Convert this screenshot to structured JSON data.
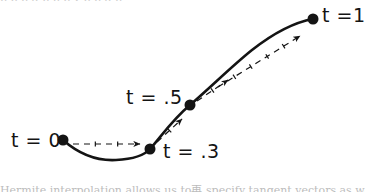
{
  "figure": {
    "background_color": "#ffffff",
    "ink_color": "#141414",
    "clipped_text_top": "p p p q p p p y p p q p",
    "clipped_text_bottom": "Hermite interpolation allows us to再 specify tangent vectors as well as positions",
    "labels": [
      {
        "id": "t0",
        "text": "t = 0",
        "value": 0.0
      },
      {
        "id": "t03",
        "text": "t = .3",
        "value": 0.3
      },
      {
        "id": "t05",
        "text": "t = .5",
        "value": 0.5
      },
      {
        "id": "t1",
        "text": "t =1",
        "value": 1.0
      }
    ]
  },
  "chart_data": {
    "type": "line",
    "title": "",
    "subtitle": "",
    "xlabel": "",
    "ylabel": "",
    "xlim": [
      0,
      365
    ],
    "ylim": [
      192,
      0
    ],
    "grid": false,
    "legend": "none",
    "knots": [
      {
        "label": "t = 0",
        "t": 0.0,
        "x": 63,
        "y": 140
      },
      {
        "label": "t = .3",
        "t": 0.3,
        "x": 150,
        "y": 149
      },
      {
        "label": "t = .5",
        "t": 0.5,
        "x": 190,
        "y": 105
      },
      {
        "label": "t =1",
        "t": 1.0,
        "x": 313,
        "y": 19
      }
    ],
    "curve_path": "M 63 140 C 80 155, 98 161, 116 160 C 134 159, 144 156, 150 149 C 160 138, 172 120, 190 105 C 212 86, 232 66, 252 50 C 275 32, 296 22, 313 19",
    "tangent_arrows": [
      {
        "at_knot": "t = 0",
        "style": "dashed-with-arrowhead",
        "x1": 73,
        "y1": 144,
        "x2": 140,
        "y2": 144,
        "direction": "horizontal-right",
        "tick_count": 2
      },
      {
        "at_knot": "t = .3",
        "style": "dashed-with-arrowhead",
        "x1": 157,
        "y1": 142,
        "x2": 182,
        "y2": 119,
        "direction": "up-right",
        "tick_count": 1
      },
      {
        "at_knot": "t = .5",
        "style": "dashed-with-arrowhead",
        "x1": 197,
        "y1": 101,
        "x2": 228,
        "y2": 80,
        "direction": "up-right",
        "tick_count": 1
      },
      {
        "at_knot": "t =1",
        "style": "long-dashed-with-arrowhead",
        "x1": 218,
        "y1": 87,
        "x2": 300,
        "y2": 36,
        "direction": "up-right",
        "tick_count": 4
      }
    ],
    "marker": {
      "shape": "circle",
      "radius": 5.5,
      "color": "#141414"
    },
    "line": {
      "color": "#141414",
      "width": 2.6,
      "style": "solid"
    },
    "dash": {
      "color": "#141414",
      "width": 1.2,
      "style": "dashed"
    }
  }
}
